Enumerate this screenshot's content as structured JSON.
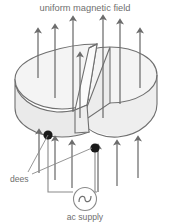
{
  "figure": {
    "type": "physics-diagram",
    "title": "uniform magnetic field",
    "labels": {
      "field": "uniform magnetic field",
      "dees": "dees",
      "supply": "ac supply"
    },
    "colors": {
      "arrow": "#6c6c6c",
      "outline": "#6f6f6f",
      "dee_fill": "#f2f2f2",
      "dee_side_fill": "#e9e9e9",
      "terminal": "#1a1a1a",
      "text": "#6f6f6f",
      "background": "#ffffff"
    },
    "elements": {
      "field_arrows_count": 13,
      "dee_count": 2,
      "terminal_count": 2,
      "source_symbol": "sine-wave",
      "hidden_edges": "dashed"
    },
    "field_arrows": [
      {
        "x": 38,
        "y_top": 31,
        "y_bottom": 78,
        "hidden_from": 62,
        "hidden_to": 78
      },
      {
        "x": 55,
        "y_top": 27,
        "y_bottom": 96,
        "hidden_from": 55,
        "hidden_to": 96
      },
      {
        "x": 73,
        "y_top": 19,
        "y_bottom": 112,
        "hidden_from": 0,
        "hidden_to": 0
      },
      {
        "x": 80,
        "y_top": 55,
        "y_bottom": 118,
        "hidden_from": 0,
        "hidden_to": 0
      },
      {
        "x": 103,
        "y_top": 18,
        "y_bottom": 118,
        "hidden_from": 0,
        "hidden_to": 0
      },
      {
        "x": 120,
        "y_top": 22,
        "y_bottom": 104,
        "hidden_from": 58,
        "hidden_to": 104
      },
      {
        "x": 140,
        "y_top": 31,
        "y_bottom": 86,
        "hidden_from": 66,
        "hidden_to": 86
      },
      {
        "x": 39,
        "y_top": 132,
        "y_bottom": 173,
        "hidden_from": 0,
        "hidden_to": 0
      },
      {
        "x": 55,
        "y_top": 139,
        "y_bottom": 180,
        "hidden_from": 0,
        "hidden_to": 0
      },
      {
        "x": 72,
        "y_top": 143,
        "y_bottom": 188,
        "hidden_from": 0,
        "hidden_to": 0
      },
      {
        "x": 98,
        "y_top": 147,
        "y_bottom": 192,
        "hidden_from": 0,
        "hidden_to": 0
      },
      {
        "x": 117,
        "y_top": 143,
        "y_bottom": 186,
        "hidden_from": 0,
        "hidden_to": 0
      },
      {
        "x": 138,
        "y_top": 139,
        "y_bottom": 178,
        "hidden_from": 0,
        "hidden_to": 0
      }
    ],
    "terminals": [
      {
        "name": "left-dee-terminal",
        "cx": 48,
        "cy": 135,
        "r": 4.6
      },
      {
        "name": "right-dee-terminal",
        "cx": 95,
        "cy": 148,
        "r": 4.6
      }
    ],
    "ac_source": {
      "cx": 85,
      "cy": 199,
      "r": 11.5,
      "symbol": "∿"
    }
  }
}
